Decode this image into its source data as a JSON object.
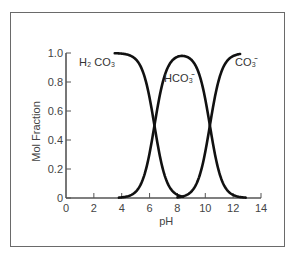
{
  "chart_data": {
    "type": "line",
    "title": "",
    "xlabel": "pH",
    "ylabel": "Mol Fraction",
    "xlim": [
      0,
      14
    ],
    "ylim": [
      0,
      1.0
    ],
    "grid": false,
    "legend": "inline labels",
    "x_ticks": [
      "0",
      "2",
      "4",
      "6",
      "8",
      "10",
      "12",
      "14"
    ],
    "y_ticks": [
      "0",
      "0.2",
      "0.4",
      "0.6",
      "0.8",
      "1.0"
    ],
    "pKa1": 6.35,
    "pKa2": 10.33,
    "x": [
      3.5,
      4,
      5,
      6,
      6.35,
      7,
      8,
      8.34,
      9,
      10,
      10.33,
      11,
      12,
      13
    ],
    "series": [
      {
        "name": "H2CO3",
        "label_main": "H₂CO₃",
        "x_range": [
          3.5,
          8.4
        ],
        "values": [
          1.0,
          0.996,
          0.957,
          0.691,
          0.5,
          0.183,
          0.022,
          0.01,
          0.002,
          0.0,
          0.0,
          0.0,
          0.0,
          0.0
        ]
      },
      {
        "name": "HCO3-",
        "label_main": "HCO₃⁻",
        "x_range": [
          3.8,
          12.9
        ],
        "values": [
          0.0,
          0.004,
          0.043,
          0.309,
          0.5,
          0.816,
          0.957,
          0.98,
          0.955,
          0.68,
          0.5,
          0.176,
          0.021,
          0.002
        ]
      },
      {
        "name": "CO3 2-",
        "label_main": "CO₃²⁻",
        "x_range": [
          8.0,
          12.5
        ],
        "values": [
          0.0,
          0.0,
          0.0,
          0.0,
          0.0,
          0.0,
          0.021,
          0.01,
          0.043,
          0.32,
          0.5,
          0.824,
          0.979,
          0.998
        ]
      }
    ]
  },
  "labels": {
    "h2co3": "H₂CO₃",
    "hco3": "HCO₃⁻",
    "co3": "CO₃⁼"
  }
}
